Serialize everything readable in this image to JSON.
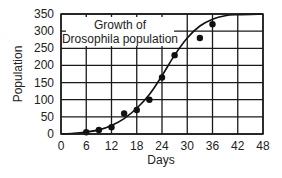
{
  "chart_data": {
    "type": "scatter",
    "title": "Growth of Drosophila population",
    "title_lines": [
      "Growth of",
      "Drosophila population"
    ],
    "xlabel": "Days",
    "ylabel": "Population",
    "xlim": [
      0,
      48
    ],
    "ylim": [
      0,
      350
    ],
    "xticks": [
      0,
      6,
      12,
      18,
      24,
      30,
      36,
      42,
      48
    ],
    "yticks": [
      0,
      50,
      100,
      150,
      200,
      250,
      300,
      350
    ],
    "grid": true,
    "legend": null,
    "series": [
      {
        "name": "Observed population",
        "kind": "points",
        "x": [
          6,
          9,
          12,
          15,
          18,
          21,
          24,
          27,
          33,
          36
        ],
        "y": [
          5,
          12,
          20,
          60,
          70,
          100,
          165,
          230,
          280,
          320
        ]
      },
      {
        "name": "Logistic fit curve",
        "kind": "curve",
        "x": [
          0,
          3,
          6,
          9,
          12,
          15,
          18,
          21,
          24,
          27,
          30,
          33,
          36,
          39,
          42,
          48
        ],
        "y": [
          0,
          2,
          6,
          12,
          25,
          45,
          75,
          115,
          170,
          230,
          280,
          315,
          335,
          345,
          348,
          350
        ]
      }
    ]
  }
}
